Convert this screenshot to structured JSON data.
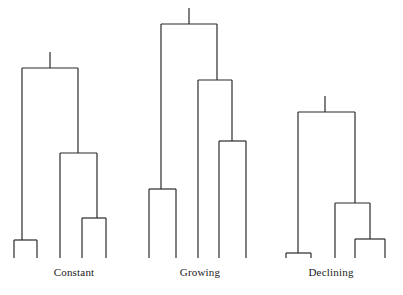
{
  "figure": {
    "width": 403,
    "height": 295,
    "background_color": "#ffffff",
    "line_color": "#2b2b2b",
    "line_width": 1.2,
    "label_color": "#1a1a1a",
    "baseline_y": 258
  },
  "panels": [
    {
      "id": "constant",
      "label": "Constant",
      "label_x": 74,
      "label_y": 266,
      "stem": {
        "x": 50,
        "y_top": 52,
        "y_bottom": 68
      },
      "nodes": [
        {
          "name": "root",
          "y": 68,
          "x_left": 22,
          "x_right": 78
        },
        {
          "name": "internal-1",
          "y": 153,
          "x_left": 60,
          "x_right": 97
        },
        {
          "name": "cherry-left",
          "y": 240,
          "x_left": 14,
          "x_right": 37
        },
        {
          "name": "cherry-right",
          "y": 218,
          "x_left": 82,
          "x_right": 106
        }
      ],
      "links": [
        {
          "from": "root.left",
          "to": "cherry-left.center",
          "x": 22
        },
        {
          "from": "root.right",
          "to": "internal-1.center",
          "x": 78
        },
        {
          "from": "internal-1.left",
          "to": "tip",
          "x": 60
        },
        {
          "from": "internal-1.right",
          "to": "cherry-right.center",
          "x": 97
        }
      ],
      "tips": [
        14,
        37,
        60,
        82,
        106
      ]
    },
    {
      "id": "growing",
      "label": "Growing",
      "label_x": 200,
      "label_y": 266,
      "stem": {
        "x": 189,
        "y_top": 8,
        "y_bottom": 24
      },
      "nodes": [
        {
          "name": "root",
          "y": 24,
          "x_left": 161,
          "x_right": 217
        },
        {
          "name": "internal-1",
          "y": 80,
          "x_left": 198,
          "x_right": 232
        },
        {
          "name": "internal-2",
          "y": 141,
          "x_left": 219,
          "x_right": 246
        },
        {
          "name": "cherry-left",
          "y": 189,
          "x_left": 149,
          "x_right": 176
        }
      ],
      "links": [
        {
          "from": "root.left",
          "to": "cherry-left.center",
          "x": 161
        },
        {
          "from": "root.right",
          "to": "internal-1.center",
          "x": 217
        },
        {
          "from": "internal-1.left",
          "to": "tip",
          "x": 198
        },
        {
          "from": "internal-1.right",
          "to": "internal-2.center",
          "x": 232
        },
        {
          "from": "internal-2.left",
          "to": "tip",
          "x": 219
        },
        {
          "from": "internal-2.right",
          "to": "tip",
          "x": 246
        }
      ],
      "tips": [
        149,
        176,
        198,
        219,
        246
      ]
    },
    {
      "id": "declining",
      "label": "Declining",
      "label_x": 331,
      "label_y": 266,
      "stem": {
        "x": 325,
        "y_top": 96,
        "y_bottom": 112
      },
      "nodes": [
        {
          "name": "root",
          "y": 112,
          "x_left": 298,
          "x_right": 355
        },
        {
          "name": "internal-1",
          "y": 203,
          "x_left": 335,
          "x_right": 370
        },
        {
          "name": "cherry-left",
          "y": 253,
          "x_left": 286,
          "x_right": 311
        },
        {
          "name": "cherry-right",
          "y": 239,
          "x_left": 355,
          "x_right": 385
        }
      ],
      "links": [
        {
          "from": "root.left",
          "to": "cherry-left.center",
          "x": 298
        },
        {
          "from": "root.right",
          "to": "internal-1.center",
          "x": 355
        },
        {
          "from": "internal-1.left",
          "to": "tip",
          "x": 335
        },
        {
          "from": "internal-1.right",
          "to": "cherry-right.center",
          "x": 370
        }
      ],
      "tips": [
        286,
        311,
        335,
        355,
        385
      ]
    }
  ]
}
